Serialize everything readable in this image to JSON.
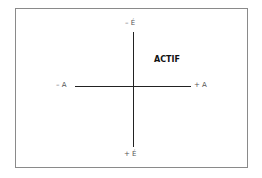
{
  "diagram": {
    "type": "quadrant-axes",
    "vertical_axis": {
      "top_label": "– É",
      "bottom_label": "+ É"
    },
    "horizontal_axis": {
      "left_label": "– A",
      "right_label": "+ A"
    },
    "quadrant_label": "ACTIF",
    "quadrant_position": "upper-right",
    "colors": {
      "axis": "#222222",
      "frame": "#8a8a8a",
      "label": "#555555",
      "quadrant_label": "#111111"
    }
  }
}
